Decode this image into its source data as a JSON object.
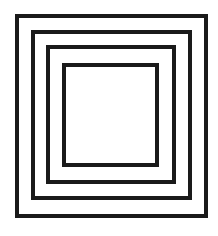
{
  "diagram": {
    "type": "nested-squares",
    "stroke_color": "#1a1a1a",
    "background": "#ffffff",
    "stroke_width": 4,
    "squares": [
      {
        "x": 17,
        "y": 16,
        "w": 189,
        "h": 200
      },
      {
        "x": 33,
        "y": 32,
        "w": 157,
        "h": 166
      },
      {
        "x": 48,
        "y": 47,
        "w": 126,
        "h": 135
      },
      {
        "x": 64,
        "y": 65,
        "w": 93,
        "h": 100
      }
    ]
  }
}
